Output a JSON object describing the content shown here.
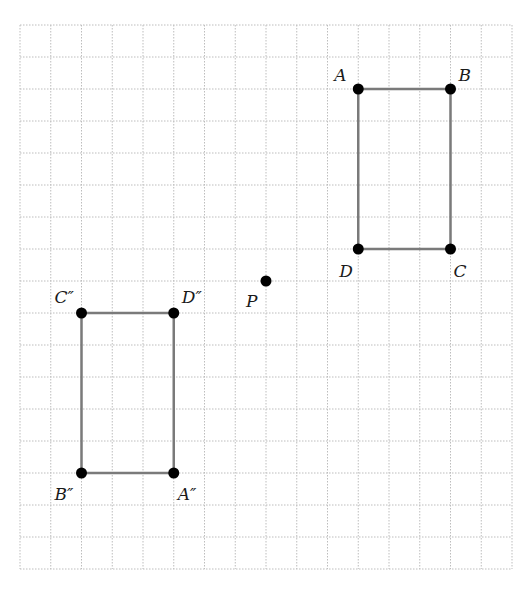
{
  "grid": {
    "left": 20,
    "top": 25,
    "cols": 16,
    "rows": 17,
    "cell_w": 30.75,
    "cell_h": 32,
    "line_color": "#bdbdbd"
  },
  "colors": {
    "segment": "#7a7a7a",
    "point": "#000000"
  },
  "shapes": [
    {
      "name": "rectangle-ABCD",
      "vertices": [
        "A",
        "B",
        "C",
        "D"
      ]
    },
    {
      "name": "rectangle-A''B''C''D''",
      "vertices": [
        "A''",
        "D''",
        "C''",
        "B''"
      ]
    }
  ],
  "points": [
    {
      "id": "A",
      "label": "A",
      "gx": 11,
      "gy": 2,
      "lx": -24,
      "ly": -8
    },
    {
      "id": "B",
      "label": "B",
      "gx": 14,
      "gy": 2,
      "lx": 8,
      "ly": -8
    },
    {
      "id": "C",
      "label": "C",
      "gx": 14,
      "gy": 7,
      "lx": 3,
      "ly": 28
    },
    {
      "id": "D",
      "label": "D",
      "gx": 11,
      "gy": 7,
      "lx": -19,
      "ly": 28
    },
    {
      "id": "P",
      "label": "P",
      "gx": 8,
      "gy": 8,
      "lx": -20,
      "ly": 26
    },
    {
      "id": "C''",
      "label": "C″",
      "gx": 2,
      "gy": 9,
      "lx": -27,
      "ly": -10
    },
    {
      "id": "D''",
      "label": "D″",
      "gx": 5,
      "gy": 9,
      "lx": 8,
      "ly": -10
    },
    {
      "id": "B''",
      "label": "B″",
      "gx": 2,
      "gy": 14,
      "lx": -27,
      "ly": 27
    },
    {
      "id": "A''",
      "label": "A″",
      "gx": 5,
      "gy": 14,
      "lx": 4,
      "ly": 27
    }
  ]
}
